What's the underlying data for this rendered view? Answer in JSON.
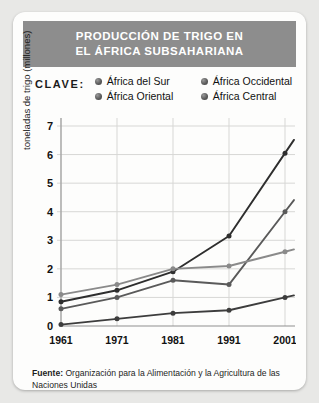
{
  "header": {
    "title_line1": "PRODUCCIÓN DE TRIGO EN",
    "title_line2": "EL ÁFRICA SUBSAHARIANA",
    "bar_color": "#8d8d8d",
    "text_color": "#ffffff"
  },
  "legend": {
    "label": "CLAVE:",
    "items": [
      {
        "name": "África del Sur"
      },
      {
        "name": "África Occidental"
      },
      {
        "name": "África Oriental"
      },
      {
        "name": "África Central"
      }
    ]
  },
  "footer": {
    "prefix": "Fuente:",
    "text": " Organización para la Alimentación y la Agricultura de las Naciones Unidas"
  },
  "chart_data": {
    "type": "line",
    "title": "PRODUCCIÓN DE TRIGO EN EL ÁFRICA SUBSAHARIANA",
    "xlabel": "",
    "ylabel": "toneladas de trigo (millones)",
    "categories": [
      "1961",
      "1971",
      "1981",
      "1991",
      "2001"
    ],
    "x": [
      1961,
      1971,
      1981,
      1991,
      2001
    ],
    "ylim": [
      0,
      7
    ],
    "yticks": [
      0,
      1,
      2,
      3,
      4,
      5,
      6,
      7
    ],
    "grid": true,
    "legend_position": "top",
    "series": [
      {
        "name": "África del Sur",
        "values": [
          0.85,
          1.25,
          1.9,
          3.15,
          6.05
        ],
        "color": "#2e2e2e"
      },
      {
        "name": "África Occidental",
        "values": [
          0.6,
          1.0,
          1.6,
          1.45,
          4.0
        ],
        "color": "#5a5a5a"
      },
      {
        "name": "África Oriental",
        "values": [
          1.1,
          1.45,
          2.0,
          2.1,
          2.6
        ],
        "color": "#8a8a8a"
      },
      {
        "name": "África Central",
        "values": [
          0.05,
          0.25,
          0.45,
          0.55,
          1.0
        ],
        "color": "#3d3d3d"
      }
    ]
  }
}
